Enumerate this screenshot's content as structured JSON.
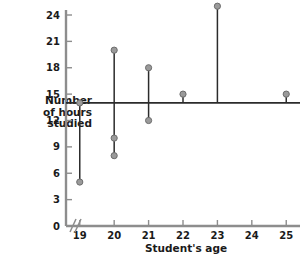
{
  "chart_data": {
    "type": "scatter",
    "title": "",
    "xlabel": "Student's age",
    "ylabel": "Number of hours studied",
    "ylabel_lines": [
      "Number",
      "of hours",
      "studied"
    ],
    "x": [
      19,
      19,
      20,
      20,
      20,
      21,
      21,
      22,
      23,
      25
    ],
    "y": [
      14,
      5,
      20,
      10,
      8,
      18,
      12,
      15,
      25,
      15
    ],
    "points": [
      {
        "x": 19,
        "y": 14
      },
      {
        "x": 19,
        "y": 5
      },
      {
        "x": 20,
        "y": 20
      },
      {
        "x": 20,
        "y": 10
      },
      {
        "x": 20,
        "y": 8
      },
      {
        "x": 21,
        "y": 18
      },
      {
        "x": 21,
        "y": 12
      },
      {
        "x": 22,
        "y": 15
      },
      {
        "x": 23,
        "y": 25
      },
      {
        "x": 25,
        "y": 15
      }
    ],
    "residual_lines": [
      {
        "x": 19,
        "y_from": 14,
        "y_to": 5
      },
      {
        "x": 20,
        "y_from": 20,
        "y_to": 8
      },
      {
        "x": 21,
        "y_from": 18,
        "y_to": 12
      },
      {
        "x": 22,
        "y_from": 15,
        "y_to": 14
      },
      {
        "x": 23,
        "y_from": 25,
        "y_to": 14
      },
      {
        "x": 25,
        "y_from": 15,
        "y_to": 14
      }
    ],
    "fit_line": {
      "y_value": 14,
      "x_from": 18.6,
      "x_to": 25.4,
      "label": "regression-line"
    },
    "xticks": [
      19,
      20,
      21,
      22,
      23,
      24,
      25
    ],
    "xtick_labels": [
      "19",
      "20",
      "21",
      "22",
      "23",
      "24",
      "25"
    ],
    "yticks": [
      0,
      3,
      6,
      9,
      12,
      15,
      18,
      21,
      24
    ],
    "ytick_labels": [
      "0",
      "3",
      "6",
      "9",
      "12",
      "15",
      "18",
      "21",
      "24"
    ],
    "xlim": [
      18.6,
      25.4
    ],
    "ylim": [
      0,
      25.6
    ],
    "grid": false,
    "legend": null,
    "axis_break": {
      "axis": "x",
      "present": true
    },
    "colors": {
      "axis": "#8d8d8d",
      "point_fill": "#9a9a9a",
      "point_stroke": "#6d6d6d",
      "residual_line": "#2b2b2b",
      "fit_line": "#2b2b2b",
      "text": "#1a1a1a",
      "background": "#ffffff"
    }
  }
}
